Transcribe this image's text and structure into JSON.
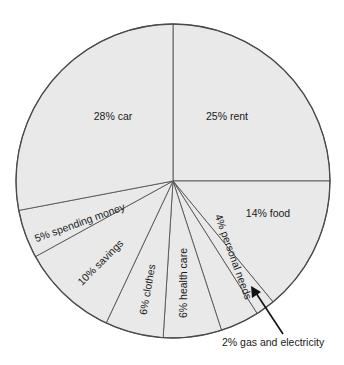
{
  "chart_data": {
    "type": "pie",
    "title": "",
    "start_angle_deg": 0,
    "direction": "clockwise",
    "categories": [
      "rent",
      "food",
      "gas and electricity",
      "personal needs",
      "health care",
      "clothes",
      "savings",
      "spending money",
      "car"
    ],
    "values": [
      25,
      14,
      2,
      4,
      6,
      6,
      10,
      5,
      28
    ],
    "labels": [
      "25% rent",
      "14% food",
      "2% gas and electricity",
      "4% personal needs",
      "6% health care",
      "6% clothes",
      "10% savings",
      "5% spending money",
      "28% car"
    ],
    "units": "%",
    "annotations": [
      {
        "text": "2% gas and electricity",
        "type": "arrow-callout",
        "target": "gas and electricity"
      }
    ],
    "colors": {
      "fill": "#e9e9e9",
      "stroke": "#555555",
      "text": "#1a1a1a"
    }
  }
}
